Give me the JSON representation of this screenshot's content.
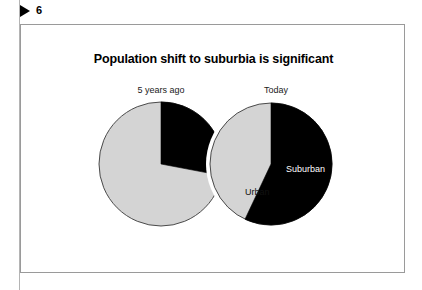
{
  "header": {
    "play_icon": "play-triangle-icon",
    "slide_number": "6"
  },
  "slide": {
    "title": "Population shift to suburbia is significant"
  },
  "colors": {
    "dark_slice": "#000000",
    "light_slice": "#d4d4d4",
    "slice_outline": "#4a4a4a",
    "frame_border": "#9a9a9a",
    "text": "#000000",
    "dark_slice_label": "#ffffff"
  },
  "chart_data": {
    "type": "pie",
    "title": "Population shift to suburbia is significant",
    "legend_position": "inline-labels",
    "charts": [
      {
        "caption": "5 years ago",
        "categories": [
          "Suburban",
          "Urban"
        ],
        "values": [
          28,
          72
        ],
        "colors": [
          "#000000",
          "#d4d4d4"
        ],
        "start_angle": 0,
        "labels_shown": []
      },
      {
        "caption": "Today",
        "categories": [
          "Suburban",
          "Urban"
        ],
        "values": [
          57,
          43
        ],
        "colors": [
          "#000000",
          "#d4d4d4"
        ],
        "start_angle": 0,
        "labels_shown": [
          "Suburban",
          "Urban"
        ]
      }
    ],
    "annotations": [
      {
        "text": "Suburban",
        "chart": 1,
        "slice": "Suburban"
      },
      {
        "text": "Urban",
        "chart": 1,
        "slice": "Urban"
      }
    ]
  }
}
